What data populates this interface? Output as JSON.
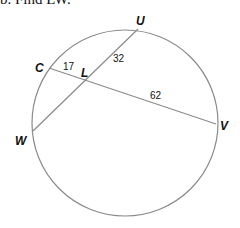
{
  "problem": {
    "title": "b. Find LW."
  },
  "diagram": {
    "points": {
      "U": "U",
      "C": "C",
      "L": "L",
      "W": "W",
      "V": "V"
    },
    "segments": {
      "CL": "17",
      "LU": "32",
      "LV": "62"
    },
    "colors": {
      "circle": "#8a8a8a",
      "lines": "#8a8a8a",
      "text": "#111111"
    }
  }
}
